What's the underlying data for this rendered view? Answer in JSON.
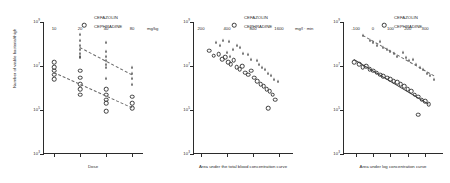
{
  "figure": {
    "panel_count": 3,
    "legend": {
      "series": [
        {
          "name": "CEFAZOLIN",
          "marker": "triangle-marker"
        },
        {
          "name": "CEPHRADINE",
          "marker": "circle-marker"
        }
      ]
    },
    "shared_y": {
      "label": "Number of viable bacteria/thigh",
      "ticks": [
        "10",
        "10",
        "10",
        "10"
      ],
      "exponents": [
        "9",
        "7",
        "5",
        "3"
      ]
    }
  },
  "chart_data": [
    {
      "type": "scatter",
      "title": "",
      "xlabel": "Dose",
      "ylabel": "Number of viable bacteria/thigh",
      "xticks": [
        "10",
        "20",
        "40",
        "80"
      ],
      "xunits": "mg/kg",
      "yticks": [
        "10⁹",
        "10⁷",
        "10⁵",
        "10³"
      ],
      "ylim": [
        1000,
        1000000000
      ],
      "yscale": "log",
      "grid": false,
      "legend_position": "top-right",
      "series": [
        {
          "name": "CEFAZOLIN",
          "marker": "triangle",
          "points": [
            [
              20,
              300000000
            ],
            [
              20,
              150000000
            ],
            [
              20,
              90000000
            ],
            [
              20,
              60000000
            ],
            [
              20,
              40000000
            ],
            [
              20,
              30000000
            ],
            [
              20,
              25000000
            ],
            [
              40,
              120000000
            ],
            [
              40,
              50000000
            ],
            [
              40,
              30000000
            ],
            [
              40,
              18000000
            ],
            [
              40,
              12000000
            ],
            [
              40,
              9000000
            ],
            [
              40,
              3000000
            ],
            [
              80,
              9000000
            ],
            [
              80,
              5000000
            ],
            [
              80,
              3000000
            ],
            [
              80,
              1500000
            ]
          ]
        },
        {
          "name": "CEPHRADINE",
          "marker": "circle",
          "points": [
            [
              10,
              15000000
            ],
            [
              10,
              9000000
            ],
            [
              10,
              6000000
            ],
            [
              10,
              4000000
            ],
            [
              10,
              2500000
            ],
            [
              20,
              6000000
            ],
            [
              20,
              3000000
            ],
            [
              20,
              1500000
            ],
            [
              20,
              900000
            ],
            [
              20,
              500000
            ],
            [
              40,
              900000
            ],
            [
              40,
              500000
            ],
            [
              40,
              300000
            ],
            [
              40,
              200000
            ],
            [
              40,
              90000
            ],
            [
              80,
              400000
            ],
            [
              80,
              200000
            ],
            [
              80,
              120000
            ]
          ]
        }
      ],
      "fit_lines": [
        {
          "series": "CEFAZOLIN",
          "style": "dashed"
        },
        {
          "series": "CEPHRADINE",
          "style": "dashed"
        }
      ]
    },
    {
      "type": "scatter",
      "title": "",
      "xlabel": "Area under the total blood concentration curve",
      "ylabel": "Number of viable bacteria/thigh",
      "xticks": [
        "200",
        "400",
        "800",
        "1600"
      ],
      "xunits": "mg/l · min",
      "yticks": [
        "10⁹",
        "10⁷",
        "10⁵",
        "10³"
      ],
      "ylim": [
        1000,
        1000000000
      ],
      "yscale": "log",
      "xscale": "log",
      "grid": false,
      "legend_position": "top-right",
      "series": [
        {
          "name": "CEFAZOLIN",
          "marker": "triangle",
          "points": [
            [
              300,
              120000000
            ],
            [
              330,
              90000000
            ],
            [
              360,
              150000000
            ],
            [
              420,
              130000000
            ],
            [
              470,
              60000000
            ],
            [
              520,
              90000000
            ],
            [
              560,
              70000000
            ],
            [
              400,
              45000000
            ],
            [
              430,
              30000000
            ],
            [
              620,
              40000000
            ],
            [
              700,
              35000000
            ],
            [
              760,
              20000000
            ],
            [
              880,
              18000000
            ],
            [
              950,
              12000000
            ],
            [
              1020,
              9000000
            ],
            [
              1100,
              7000000
            ],
            [
              1180,
              5000000
            ],
            [
              1280,
              4000000
            ],
            [
              1400,
              2500000
            ],
            [
              1550,
              2000000
            ]
          ]
        },
        {
          "name": "CEPHRADINE",
          "marker": "circle",
          "points": [
            [
              250,
              50000000
            ],
            [
              280,
              30000000
            ],
            [
              320,
              35000000
            ],
            [
              350,
              20000000
            ],
            [
              380,
              25000000
            ],
            [
              410,
              15000000
            ],
            [
              440,
              12000000
            ],
            [
              480,
              18000000
            ],
            [
              520,
              9000000
            ],
            [
              560,
              7000000
            ],
            [
              600,
              10000000
            ],
            [
              650,
              5000000
            ],
            [
              700,
              4000000
            ],
            [
              760,
              6000000
            ],
            [
              820,
              3000000
            ],
            [
              900,
              2000000
            ],
            [
              980,
              1500000
            ],
            [
              1060,
              1200000
            ],
            [
              1150,
              900000
            ],
            [
              1250,
              700000
            ],
            [
              1350,
              500000
            ],
            [
              1450,
              300000
            ],
            [
              1200,
              120000
            ]
          ]
        }
      ],
      "fit_lines": []
    },
    {
      "type": "scatter",
      "title": "",
      "xlabel": "Area under log concentration curve",
      "ylabel": "Number of viable bacteria/thigh",
      "xticks": [
        "-100",
        "0",
        "100",
        "200",
        "300"
      ],
      "xunits": "",
      "yticks": [
        "10⁹",
        "10⁷",
        "10⁵",
        "10³"
      ],
      "ylim": [
        1000,
        1000000000
      ],
      "yscale": "log",
      "grid": false,
      "legend_position": "top-right",
      "series": [
        {
          "name": "CEFAZOLIN",
          "marker": "triangle",
          "points": [
            [
              -60,
              250000000
            ],
            [
              -20,
              150000000
            ],
            [
              0,
              120000000
            ],
            [
              20,
              90000000
            ],
            [
              40,
              130000000
            ],
            [
              60,
              70000000
            ],
            [
              80,
              60000000
            ],
            [
              100,
              50000000
            ],
            [
              120,
              40000000
            ],
            [
              140,
              30000000
            ],
            [
              170,
              45000000
            ],
            [
              190,
              25000000
            ],
            [
              210,
              18000000
            ],
            [
              230,
              20000000
            ],
            [
              250,
              12000000
            ],
            [
              270,
              9000000
            ],
            [
              290,
              7000000
            ],
            [
              310,
              5000000
            ],
            [
              330,
              4000000
            ],
            [
              350,
              2500000
            ]
          ]
        },
        {
          "name": "CEPHRADINE",
          "marker": "circle",
          "points": [
            [
              -110,
              15000000
            ],
            [
              -80,
              12000000
            ],
            [
              -60,
              9000000
            ],
            [
              -40,
              10000000
            ],
            [
              -20,
              7000000
            ],
            [
              0,
              6000000
            ],
            [
              20,
              5000000
            ],
            [
              40,
              4000000
            ],
            [
              60,
              3500000
            ],
            [
              80,
              3000000
            ],
            [
              100,
              2500000
            ],
            [
              120,
              2000000
            ],
            [
              140,
              1800000
            ],
            [
              160,
              1500000
            ],
            [
              180,
              1200000
            ],
            [
              200,
              900000
            ],
            [
              220,
              700000
            ],
            [
              240,
              500000
            ],
            [
              260,
              400000
            ],
            [
              280,
              300000
            ],
            [
              300,
              250000
            ],
            [
              320,
              180000
            ],
            [
              260,
              60000
            ]
          ]
        }
      ],
      "fit_lines": [
        {
          "series": "CEFAZOLIN",
          "style": "dashed"
        },
        {
          "series": "CEPHRADINE",
          "style": "solid"
        }
      ]
    }
  ]
}
